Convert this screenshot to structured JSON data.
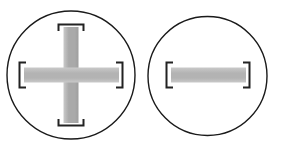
{
  "figure": {
    "background_color": "#ffffff",
    "width": 281,
    "height": 149,
    "outline_color": "#1a1a1a",
    "circle_stroke_width": 1.4,
    "slot_outline_color": "#222222",
    "slot_outline_width": 2.0,
    "fill_vertical": "#a9a9a9",
    "fill_horizontal": "#b3b3b3",
    "fill_highlight": "#c9c9c9"
  },
  "items": [
    {
      "id": "phillips-head",
      "name": "Phillips cross-slot screw head",
      "head_type": "cross",
      "circle": {
        "cx": 71,
        "cy": 75,
        "r": 64
      },
      "slots": [
        {
          "id": "vertical-slot",
          "orientation": "vertical",
          "x": 63.5,
          "y": 27,
          "width": 15,
          "height": 96,
          "fill": "#a9a9a9"
        },
        {
          "id": "horizontal-slot",
          "orientation": "horizontal",
          "x": 24,
          "y": 67.5,
          "width": 95,
          "height": 15,
          "fill": "#b3b3b3"
        }
      ],
      "brackets": [
        {
          "id": "bracket-top",
          "d": "M 58.5 31 L 58.5 24.5 L 83.5 24.5 L 83.5 31"
        },
        {
          "id": "bracket-bottom",
          "d": "M 58.5 119 L 58.5 125.5 L 83.5 125.5 L 83.5 119"
        },
        {
          "id": "bracket-left",
          "d": "M 26 62.5 L 19.5 62.5 L 19.5 87.5 L 26 87.5"
        },
        {
          "id": "bracket-right",
          "d": "M 116 62.5 L 122.5 62.5 L 122.5 87.5 L 116 87.5"
        }
      ]
    },
    {
      "id": "slotted-head",
      "name": "Slotted flat screw head",
      "head_type": "slot",
      "circle": {
        "cx": 207.5,
        "cy": 76,
        "r": 59.5
      },
      "slots": [
        {
          "id": "horizontal-slot",
          "orientation": "horizontal",
          "x": 171,
          "y": 67.5,
          "width": 75,
          "height": 15,
          "fill": "#b3b3b3"
        }
      ],
      "brackets": [
        {
          "id": "bracket-left",
          "d": "M 173 62.5 L 166.5 62.5 L 166.5 87.5 L 173 87.5"
        },
        {
          "id": "bracket-right",
          "d": "M 243 62.5 L 249.5 62.5 L 249.5 87.5 L 243 87.5"
        }
      ]
    }
  ]
}
